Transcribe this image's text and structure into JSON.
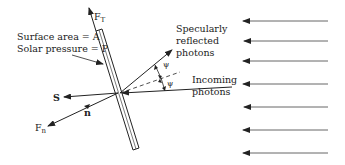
{
  "diagram": {
    "labels": {
      "surface_area": "Surface area = A",
      "solar_pressure": "Solar pressure = P",
      "ft_main": "F",
      "ft_sub": "T",
      "fn_main": "F",
      "fn_sub": "n",
      "s": "S",
      "n": "n",
      "psi_top": "ψ",
      "psi_bottom": "ψ",
      "specular_1": "Specularly",
      "specular_2": "reflected",
      "specular_3": "photons",
      "incoming_1": "Incoming",
      "incoming_2": "photons"
    },
    "incoming_arrow_rows_y": [
      21,
      41,
      61,
      84,
      107,
      130,
      153
    ],
    "colors": {
      "line": "#222222",
      "background": "#ffffff"
    }
  }
}
